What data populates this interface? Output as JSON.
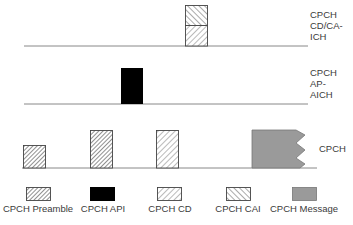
{
  "channels": [
    {
      "id": "cd-caich",
      "label_lines": [
        "CPCH",
        "CD/CA-",
        "ICH"
      ]
    },
    {
      "id": "ap-aich",
      "label_lines": [
        "CPCH",
        "AP-",
        "AICH"
      ]
    },
    {
      "id": "cpch",
      "label_lines": [
        "CPCH"
      ]
    }
  ],
  "legend": [
    {
      "key": "preamble",
      "label": "CPCH Preamble"
    },
    {
      "key": "api",
      "label": "CPCH API"
    },
    {
      "key": "cd",
      "label": "CPCH CD"
    },
    {
      "key": "cai",
      "label": "CPCH CAI"
    },
    {
      "key": "message",
      "label": "CPCH Message"
    }
  ],
  "colors": {
    "line": "#888888",
    "api_fill": "#000000",
    "message_fill": "#9a9a9a",
    "hatch": "#555555"
  }
}
